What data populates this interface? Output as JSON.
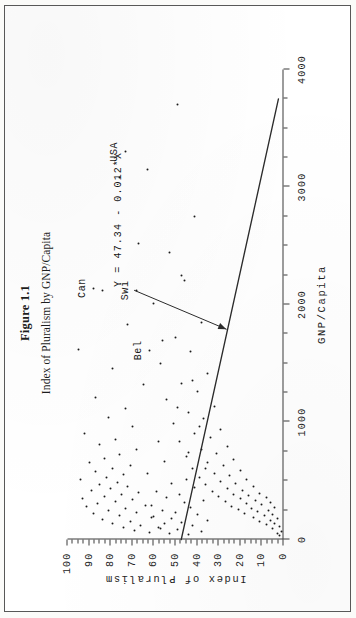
{
  "figure": {
    "title": "Figure 1.1",
    "subtitle": "Index of Pluralism by GNP/Capita"
  },
  "annotation": {
    "equation": "Y = 47.34 - 0.012*X"
  },
  "chart_data": {
    "type": "scatter",
    "title": "Figure 1.1",
    "subtitle": "Index of Pluralism by GNP/Capita",
    "xlabel": "GNP/Capita",
    "ylabel": "Index of Pluralism",
    "xlim": [
      0,
      4000
    ],
    "ylim": [
      0,
      100
    ],
    "xticks": [
      0,
      1000,
      2000,
      3000,
      4000
    ],
    "xticklabels": [
      "0",
      "1000",
      "2000",
      "3000",
      "4000"
    ],
    "xminorstep": 250,
    "yticks": [
      0,
      10,
      20,
      30,
      40,
      50,
      60,
      70,
      80,
      90,
      100
    ],
    "yticklabels": [
      "0",
      "10",
      "20",
      "30",
      "40",
      "50",
      "60",
      "70",
      "80",
      "90",
      "100"
    ],
    "yminorstep": 2.5,
    "grid": false,
    "legend": null,
    "marker": "dot",
    "regression": {
      "label": "Y = 47.34 - 0.012*X",
      "intercept": 47.34,
      "slope": -0.012,
      "x_start": 0,
      "y_start": 47.34,
      "x_end": 3750,
      "y_end": 2.34
    },
    "points": [
      [
        30,
        2
      ],
      [
        55,
        3
      ],
      [
        70,
        1
      ],
      [
        95,
        5
      ],
      [
        110,
        2
      ],
      [
        125,
        8
      ],
      [
        140,
        4
      ],
      [
        150,
        11
      ],
      [
        165,
        6
      ],
      [
        180,
        3
      ],
      [
        190,
        14
      ],
      [
        205,
        9
      ],
      [
        215,
        5
      ],
      [
        225,
        18
      ],
      [
        235,
        12
      ],
      [
        245,
        7
      ],
      [
        255,
        21
      ],
      [
        265,
        15
      ],
      [
        275,
        4
      ],
      [
        285,
        24
      ],
      [
        295,
        10
      ],
      [
        305,
        17
      ],
      [
        315,
        6
      ],
      [
        325,
        27
      ],
      [
        335,
        13
      ],
      [
        345,
        20
      ],
      [
        355,
        8
      ],
      [
        365,
        30
      ],
      [
        375,
        16
      ],
      [
        385,
        23
      ],
      [
        395,
        11
      ],
      [
        405,
        33
      ],
      [
        420,
        19
      ],
      [
        435,
        26
      ],
      [
        450,
        14
      ],
      [
        465,
        36
      ],
      [
        480,
        22
      ],
      [
        495,
        29
      ],
      [
        510,
        17
      ],
      [
        525,
        39
      ],
      [
        545,
        25
      ],
      [
        565,
        32
      ],
      [
        585,
        20
      ],
      [
        605,
        42
      ],
      [
        630,
        28
      ],
      [
        655,
        35
      ],
      [
        680,
        23
      ],
      [
        705,
        45
      ],
      [
        735,
        31
      ],
      [
        765,
        38
      ],
      [
        795,
        26
      ],
      [
        830,
        48
      ],
      [
        865,
        34
      ],
      [
        900,
        41
      ],
      [
        940,
        29
      ],
      [
        985,
        51
      ],
      [
        1030,
        37
      ],
      [
        1080,
        44
      ],
      [
        1135,
        32
      ],
      [
        1195,
        54
      ],
      [
        1260,
        40
      ],
      [
        1330,
        47
      ],
      [
        1410,
        35
      ],
      [
        1500,
        57
      ],
      [
        1600,
        43
      ],
      [
        1715,
        50
      ],
      [
        1850,
        38
      ],
      [
        2010,
        60
      ],
      [
        2200,
        46
      ],
      [
        2440,
        53
      ],
      [
        2750,
        41
      ],
      [
        3150,
        63
      ],
      [
        3700,
        49
      ],
      [
        60,
        62
      ],
      [
        75,
        69
      ],
      [
        90,
        57
      ],
      [
        105,
        74
      ],
      [
        120,
        66
      ],
      [
        135,
        79
      ],
      [
        155,
        71
      ],
      [
        170,
        84
      ],
      [
        185,
        61
      ],
      [
        200,
        76
      ],
      [
        218,
        88
      ],
      [
        232,
        68
      ],
      [
        248,
        81
      ],
      [
        262,
        73
      ],
      [
        278,
        91
      ],
      [
        292,
        64
      ],
      [
        308,
        86
      ],
      [
        322,
        78
      ],
      [
        338,
        70
      ],
      [
        352,
        93
      ],
      [
        368,
        83
      ],
      [
        382,
        75
      ],
      [
        398,
        67
      ],
      [
        415,
        89
      ],
      [
        432,
        80
      ],
      [
        448,
        72
      ],
      [
        468,
        85
      ],
      [
        488,
        77
      ],
      [
        508,
        94
      ],
      [
        530,
        82
      ],
      [
        552,
        74
      ],
      [
        578,
        87
      ],
      [
        602,
        79
      ],
      [
        628,
        71
      ],
      [
        658,
        90
      ],
      [
        690,
        83
      ],
      [
        725,
        76
      ],
      [
        762,
        68
      ],
      [
        805,
        85
      ],
      [
        852,
        78
      ],
      [
        905,
        92
      ],
      [
        965,
        70
      ],
      [
        1035,
        81
      ],
      [
        1115,
        73
      ],
      [
        1210,
        87
      ],
      [
        1320,
        65
      ],
      [
        1455,
        79
      ],
      [
        1620,
        95
      ],
      [
        1830,
        72
      ],
      [
        2120,
        84
      ],
      [
        2520,
        67
      ],
      [
        3080,
        76
      ],
      [
        40,
        44
      ],
      [
        52,
        53
      ],
      [
        68,
        38
      ],
      [
        82,
        49
      ],
      [
        98,
        58
      ],
      [
        115,
        42
      ],
      [
        132,
        55
      ],
      [
        148,
        47
      ],
      [
        162,
        35
      ],
      [
        178,
        52
      ],
      [
        196,
        60
      ],
      [
        212,
        40
      ],
      [
        230,
        50
      ],
      [
        250,
        56
      ],
      [
        270,
        43
      ],
      [
        290,
        61
      ],
      [
        312,
        46
      ],
      [
        334,
        37
      ],
      [
        358,
        54
      ],
      [
        384,
        48
      ],
      [
        412,
        59
      ],
      [
        442,
        41
      ],
      [
        476,
        52
      ],
      [
        514,
        45
      ],
      [
        558,
        63
      ],
      [
        608,
        36
      ],
      [
        668,
        55
      ],
      [
        742,
        44
      ],
      [
        835,
        58
      ],
      [
        960,
        39
      ],
      [
        1125,
        49
      ],
      [
        1355,
        42
      ],
      [
        1690,
        56
      ],
      [
        2250,
        47
      ]
    ],
    "annotated_points": [
      {
        "label": "USA",
        "x": 3300,
        "y": 73
      },
      {
        "label": "Can",
        "x": 2140,
        "y": 88
      },
      {
        "label": "Swi",
        "x": 2120,
        "y": 68
      },
      {
        "label": "Bel",
        "x": 1610,
        "y": 62
      }
    ]
  }
}
